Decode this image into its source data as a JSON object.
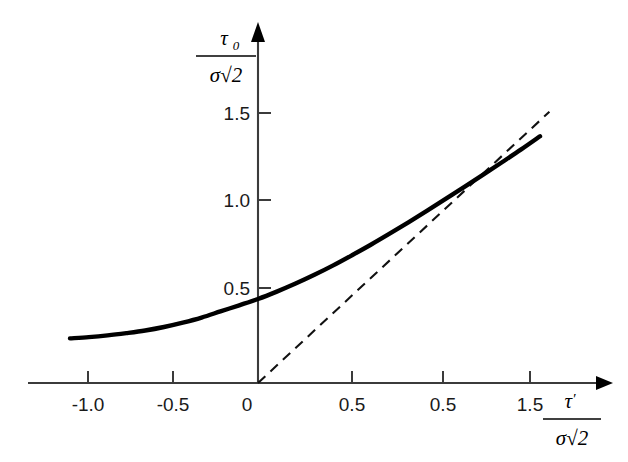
{
  "chart_data": {
    "type": "line",
    "title": "",
    "subtitle": "",
    "xlabel": "τ′ / (σ√2)",
    "ylabel": "τ₀ / (σ√2)",
    "xlabel_parts": {
      "numerator_symbol": "τ",
      "numerator_prime": "′",
      "denominator": "σ√2"
    },
    "ylabel_parts": {
      "numerator_symbol": "τ",
      "numerator_subscript": "0",
      "denominator": "σ√2"
    },
    "grid": false,
    "legend": "none",
    "xlim": [
      -1.25,
      1.85
    ],
    "ylim": [
      -0.08,
      1.95
    ],
    "xticks": [
      -1.0,
      -0.5,
      0.0,
      0.5,
      1.0,
      1.5
    ],
    "xtick_labels": [
      "-1.0",
      "-0.5",
      "0",
      "0.5",
      "0.5",
      "1.5"
    ],
    "yticks": [
      0.5,
      1.0,
      1.5
    ],
    "ytick_labels": [
      "0.5",
      "1.0",
      "1.5"
    ],
    "series": [
      {
        "name": "solid-curve",
        "style": "solid",
        "color": "#000000",
        "x": [
          -1.0,
          -0.9,
          -0.8,
          -0.7,
          -0.6,
          -0.5,
          -0.4,
          -0.3,
          -0.2,
          -0.1,
          0.0,
          0.1,
          0.2,
          0.3,
          0.4,
          0.5,
          0.6,
          0.7,
          0.8,
          0.9,
          1.0,
          1.1,
          1.2,
          1.3,
          1.4,
          1.5
        ],
        "values": [
          0.255,
          0.262,
          0.272,
          0.285,
          0.3,
          0.32,
          0.345,
          0.374,
          0.409,
          0.444,
          0.48,
          0.522,
          0.568,
          0.618,
          0.672,
          0.73,
          0.79,
          0.853,
          0.918,
          0.985,
          1.053,
          1.122,
          1.192,
          1.263,
          1.335,
          1.41
        ]
      },
      {
        "name": "dashed-asymptote",
        "style": "dashed",
        "color": "#111111",
        "x": [
          0.0,
          1.55
        ],
        "values": [
          0.0,
          1.55
        ]
      }
    ],
    "annotations": [
      {
        "name": "y-axis-arrow",
        "text": ""
      },
      {
        "name": "x-axis-arrow",
        "text": ""
      }
    ]
  }
}
